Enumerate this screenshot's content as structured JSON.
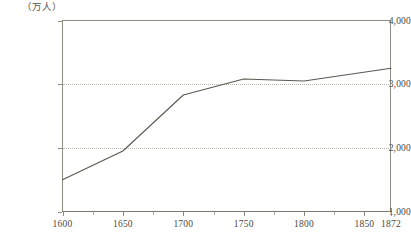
{
  "top_caption": "",
  "axis": {
    "unit_label": "（万人）",
    "y_ticks": [
      "4,000",
      "3,000",
      "2,000",
      "1,000"
    ],
    "x_ticks": [
      "1600",
      "1650",
      "1700",
      "1750",
      "1800",
      "1850",
      "1872"
    ]
  },
  "colors": {
    "line": "#595951",
    "frame": "#8d8d82",
    "grid": "#b9b9ae",
    "text": "#4a4a42",
    "background": "#ffffff"
  },
  "chart_data": {
    "type": "line",
    "title": "",
    "xlabel": "",
    "ylabel": "（万人）",
    "xlim": [
      1600,
      1872
    ],
    "ylim": [
      1000,
      4000
    ],
    "grid": true,
    "gridlines_y": [
      2000,
      3000
    ],
    "legend": "none",
    "x": [
      1600,
      1650,
      1700,
      1750,
      1800,
      1872
    ],
    "values": [
      1500,
      1950,
      2830,
      3080,
      3050,
      3250
    ],
    "series": [
      {
        "name": "人口",
        "x": [
          1600,
          1650,
          1700,
          1750,
          1800,
          1872
        ],
        "values": [
          1500,
          1950,
          2830,
          3080,
          3050,
          3250
        ]
      }
    ],
    "y_tick_values": [
      1000,
      2000,
      3000,
      4000
    ],
    "x_tick_values": [
      1600,
      1650,
      1700,
      1750,
      1800,
      1850,
      1872
    ],
    "x_minor_tick_values": [
      1625,
      1675,
      1725,
      1775,
      1825
    ]
  }
}
